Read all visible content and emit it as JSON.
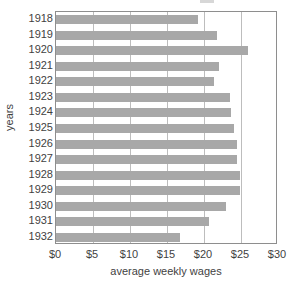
{
  "chart_data": {
    "type": "bar",
    "orientation": "horizontal",
    "title": "",
    "xlabel": "average weekly wages",
    "ylabel": "years",
    "categories": [
      "1918",
      "1919",
      "1920",
      "1921",
      "1922",
      "1923",
      "1924",
      "1925",
      "1926",
      "1927",
      "1928",
      "1929",
      "1930",
      "1931",
      "1932"
    ],
    "values": [
      19.2,
      21.8,
      25.9,
      22.0,
      21.3,
      23.5,
      23.6,
      24.1,
      24.4,
      24.5,
      24.8,
      24.8,
      23.0,
      20.7,
      16.8
    ],
    "xlim": [
      0,
      30
    ],
    "xticks": [
      0,
      5,
      10,
      15,
      20,
      25,
      30
    ],
    "xtick_labels": [
      "$0",
      "$5",
      "$10",
      "$15",
      "$20",
      "$25",
      "$30"
    ],
    "grid": "vertical",
    "legend": "none",
    "bar_color": "#a8a8a8",
    "gridline_color": "#bdbdbd",
    "frame_color": "#8e8e8e"
  }
}
